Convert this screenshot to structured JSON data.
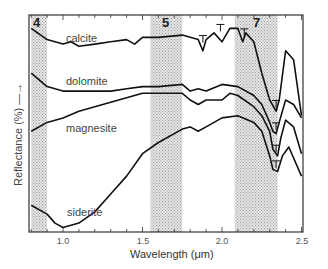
{
  "chart_data": {
    "type": "line",
    "title": "",
    "xlabel": "Wavelength (μm)",
    "ylabel": "Reflectance (%) →",
    "xlim": [
      0.8,
      2.5
    ],
    "x_ticks": [
      "1.0",
      "1.5",
      "2.0",
      "2.5"
    ],
    "grid": false,
    "legend": "inline labels",
    "bands": [
      {
        "label": "4",
        "from": 0.8,
        "to": 0.9
      },
      {
        "label": "5",
        "from": 1.55,
        "to": 1.75
      },
      {
        "label": "7",
        "from": 2.08,
        "to": 2.35
      }
    ],
    "series": [
      {
        "name": "calcite",
        "x": [
          0.8,
          0.9,
          1.0,
          1.05,
          1.1,
          1.2,
          1.3,
          1.4,
          1.45,
          1.5,
          1.6,
          1.75,
          1.85,
          1.88,
          1.9,
          1.95,
          2.0,
          2.05,
          2.1,
          2.13,
          2.15,
          2.2,
          2.25,
          2.3,
          2.34,
          2.36,
          2.4,
          2.45,
          2.5
        ],
        "y": [
          0.84,
          0.79,
          0.77,
          0.78,
          0.76,
          0.77,
          0.78,
          0.79,
          0.77,
          0.8,
          0.8,
          0.81,
          0.79,
          0.74,
          0.79,
          0.82,
          0.78,
          0.84,
          0.84,
          0.78,
          0.82,
          0.78,
          0.64,
          0.52,
          0.47,
          0.52,
          0.74,
          0.7,
          0.45
        ]
      },
      {
        "name": "dolomite",
        "x": [
          0.8,
          0.9,
          1.0,
          1.1,
          1.2,
          1.3,
          1.4,
          1.5,
          1.6,
          1.75,
          1.8,
          1.85,
          1.9,
          2.0,
          2.1,
          2.2,
          2.25,
          2.3,
          2.32,
          2.34,
          2.36,
          2.4,
          2.45,
          2.5
        ],
        "y": [
          0.64,
          0.58,
          0.56,
          0.56,
          0.56,
          0.56,
          0.57,
          0.58,
          0.58,
          0.59,
          0.56,
          0.57,
          0.56,
          0.59,
          0.58,
          0.54,
          0.5,
          0.42,
          0.38,
          0.37,
          0.42,
          0.52,
          0.5,
          0.44
        ]
      },
      {
        "name": "magnesite",
        "x": [
          0.8,
          0.9,
          1.0,
          1.1,
          1.2,
          1.3,
          1.4,
          1.5,
          1.6,
          1.75,
          1.8,
          1.85,
          1.9,
          2.0,
          2.05,
          2.1,
          2.2,
          2.25,
          2.3,
          2.32,
          2.35,
          2.37,
          2.4,
          2.45,
          2.5
        ],
        "y": [
          0.38,
          0.42,
          0.44,
          0.47,
          0.49,
          0.51,
          0.53,
          0.55,
          0.55,
          0.55,
          0.52,
          0.5,
          0.52,
          0.52,
          0.55,
          0.54,
          0.49,
          0.45,
          0.38,
          0.3,
          0.27,
          0.35,
          0.43,
          0.4,
          0.28
        ]
      },
      {
        "name": "siderite",
        "x": [
          0.8,
          0.9,
          0.95,
          1.0,
          1.05,
          1.1,
          1.2,
          1.3,
          1.4,
          1.5,
          1.6,
          1.75,
          1.8,
          1.85,
          1.9,
          2.0,
          2.1,
          2.2,
          2.25,
          2.3,
          2.32,
          2.35,
          2.38,
          2.42,
          2.5
        ],
        "y": [
          0.05,
          0.01,
          -0.03,
          -0.05,
          -0.04,
          -0.03,
          0.02,
          0.1,
          0.18,
          0.28,
          0.33,
          0.39,
          0.4,
          0.38,
          0.4,
          0.44,
          0.45,
          0.42,
          0.38,
          0.27,
          0.21,
          0.2,
          0.27,
          0.31,
          0.18
        ]
      }
    ]
  },
  "labels": {
    "calcite": "calcite",
    "dolomite": "dolomite",
    "magnesite": "magnesite",
    "siderite": "siderite",
    "band4": "4",
    "band5": "5",
    "band7": "7",
    "tick_10": "1.0",
    "tick_15": "1.5",
    "tick_20": "2.0",
    "tick_25": "2.5",
    "xlabel": "Wavelength (μm)",
    "ylabel": "Reflectance (%) —→"
  },
  "colors": {
    "line": "#111111",
    "band_fill": "#cfcfcf",
    "frame": "#333333"
  }
}
